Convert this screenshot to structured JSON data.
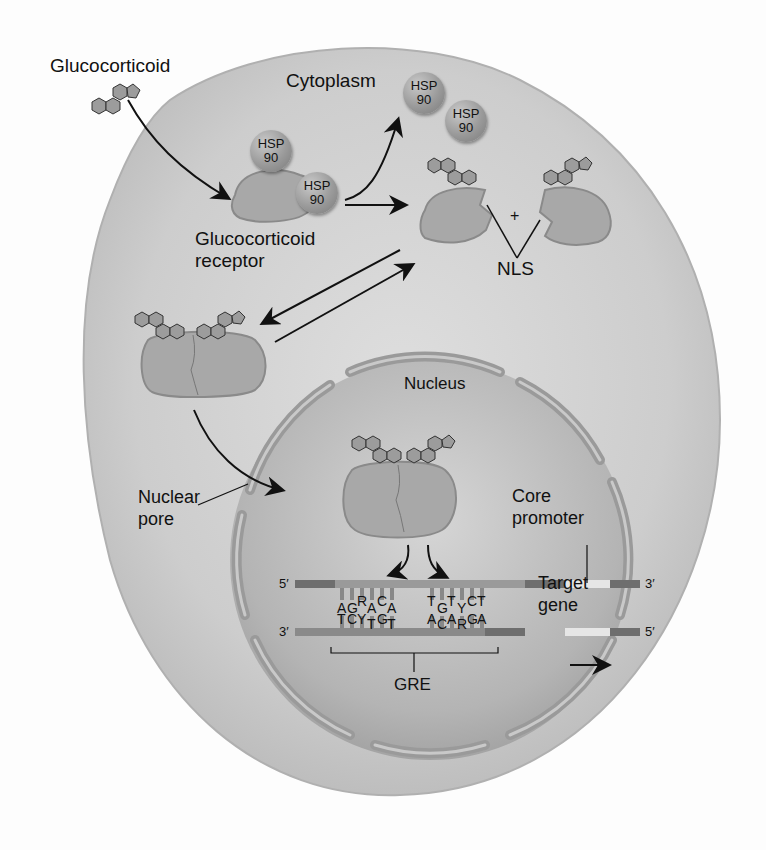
{
  "figure": {
    "type": "biology-diagram"
  },
  "labels": {
    "glucocorticoid": "Glucocorticoid",
    "cytoplasm": "Cytoplasm",
    "glucocorticoid_receptor_line1": "Glucocorticoid",
    "glucocorticoid_receptor_line2": "receptor",
    "nls": "NLS",
    "plus": "+",
    "nucleus": "Nucleus",
    "nuclear_pore_line1": "Nuclear",
    "nuclear_pore_line2": "pore",
    "core_promoter_line1": "Core",
    "core_promoter_line2": "promoter",
    "target_gene_line1": "Target",
    "target_gene_line2": "gene",
    "gre": "GRE"
  },
  "hsp90": [
    {
      "line1": "HSP",
      "line2": "90"
    },
    {
      "line1": "HSP",
      "line2": "90"
    },
    {
      "line1": "HSP",
      "line2": "90"
    },
    {
      "line1": "HSP",
      "line2": "90"
    }
  ],
  "dna": {
    "top_strand_5prime": "5′",
    "top_strand_3prime": "3′",
    "bottom_strand_3prime": "3′",
    "bottom_strand_5prime": "5′",
    "left_halfsite_top": [
      "A",
      "G",
      "R",
      "A",
      "C",
      "A"
    ],
    "left_halfsite_bottom": [
      "T",
      "C",
      "Y",
      "T",
      "G",
      "T"
    ],
    "right_halfsite_top": [
      "T",
      "G",
      "T",
      "Y",
      "C",
      "T"
    ],
    "right_halfsite_bottom": [
      "A",
      "C",
      "A",
      "R",
      "G",
      "A"
    ]
  },
  "colors": {
    "cell": "#cfcfcf",
    "nucleus": "#bdbdbd",
    "receptor": "#a8a8a8",
    "envelope": "#999999",
    "hormone": "#9c9c9c",
    "dna_dark": "#6e6e6e",
    "dna_light": "#d8d8d8"
  }
}
